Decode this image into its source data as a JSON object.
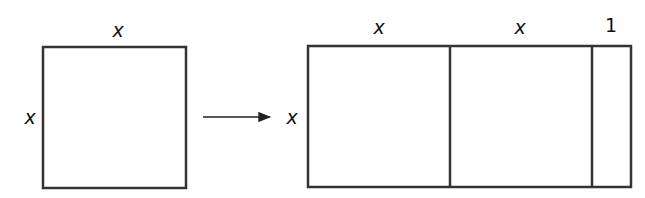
{
  "left_figure": {
    "top_label": "x",
    "side_label": "x"
  },
  "arrow": {
    "direction": "right"
  },
  "right_figure": {
    "side_label": "x",
    "segment_labels": [
      "x",
      "x",
      "1"
    ]
  }
}
